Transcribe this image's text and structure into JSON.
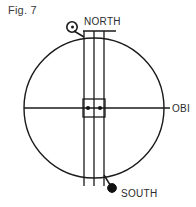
{
  "figure": {
    "caption": "Fig. 7",
    "type": "technical-line-drawing"
  },
  "labels": {
    "north": "NORTH",
    "south": "SOUTH",
    "obi": "OBI"
  },
  "markers": {
    "north_marker": "open-circle-marker",
    "south_marker": "filled-dot-marker",
    "center_left_dot": "filled-dot-marker",
    "center_right_dot": "filled-dot-marker"
  },
  "geometry": {
    "circle_center_x": 94,
    "circle_center_y": 108,
    "circle_radius": 70,
    "band_left_x": 84,
    "band_mid_x": 94,
    "band_right_x": 104,
    "band_top_y": 31,
    "band_bottom_y": 186,
    "center_box_top_y": 99,
    "center_box_bottom_y": 117,
    "equator_y": 108
  },
  "colors": {
    "stroke": "#1a1a1a",
    "text": "#2b2b2b",
    "background": "#ffffff"
  }
}
